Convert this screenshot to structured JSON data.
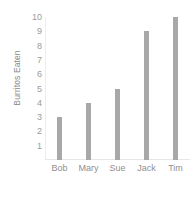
{
  "chart_data": {
    "type": "bar",
    "title": "",
    "subtitle": "",
    "xlabel": "",
    "ylabel": "Burritos Eaten",
    "categories": [
      "Bob",
      "Mary",
      "Sue",
      "Jack",
      "Tim"
    ],
    "values": [
      3,
      4,
      5,
      9,
      10
    ],
    "ylim": [
      0,
      10
    ],
    "yticks": [
      1,
      2,
      3,
      4,
      5,
      6,
      7,
      8,
      9,
      10
    ],
    "ytick_labels": [
      "1",
      "2",
      "3",
      "4",
      "5",
      "6",
      "7",
      "8",
      "9",
      "10"
    ],
    "grid": false,
    "legend": false,
    "legend_position": "none",
    "bar_color": "#a8a8a8",
    "axis_color": "#e6e6e6",
    "text_color": "#8f8f8f",
    "background_color": "#ffffff"
  }
}
